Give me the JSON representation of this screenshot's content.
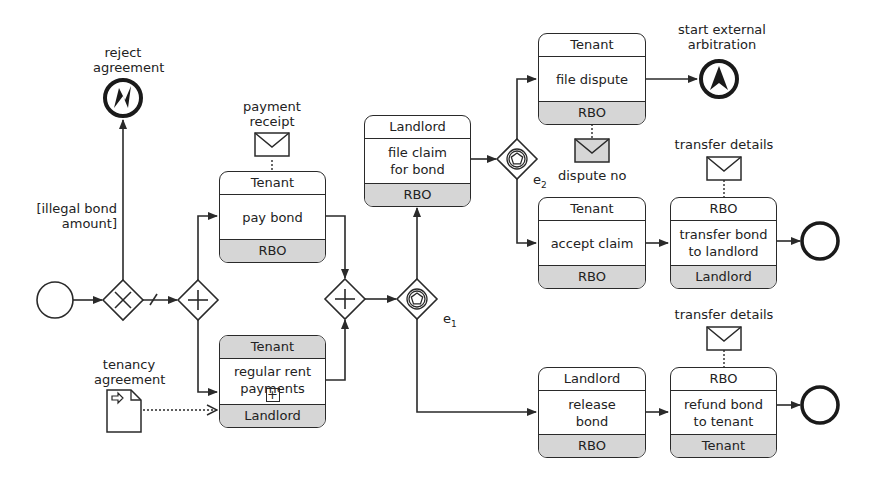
{
  "diagram": {
    "type": "BPMN choreography",
    "events": {
      "start": {
        "label": ""
      },
      "reject_agreement": {
        "label_line1": "reject",
        "label_line2": "agreement",
        "icon": "error-end-icon"
      },
      "start_arbitration": {
        "label_line1": "start external",
        "label_line2": "arbitration",
        "icon": "escalation-end-icon"
      },
      "end_transfer": {
        "label": ""
      },
      "end_refund": {
        "label": ""
      }
    },
    "conditions": {
      "illegal_bond_line1": "[illegal bond",
      "illegal_bond_line2": "amount]"
    },
    "gateways": {
      "xor": {
        "type": "exclusive"
      },
      "split": {
        "type": "parallel"
      },
      "join": {
        "type": "parallel"
      },
      "e1": {
        "type": "event-based",
        "label": "e",
        "sub": "1"
      },
      "e2": {
        "type": "event-based",
        "label": "e",
        "sub": "2"
      }
    },
    "messages": {
      "payment_receipt": {
        "line1": "payment",
        "line2": "receipt"
      },
      "dispute_no": {
        "label": "dispute no"
      },
      "transfer_details_1": {
        "label": "transfer details"
      },
      "transfer_details_2": {
        "label": "transfer details"
      }
    },
    "data_objects": {
      "tenancy_agreement": {
        "line1": "tenancy",
        "line2": "agreement"
      }
    },
    "tasks": {
      "pay_bond": {
        "top": "Tenant",
        "name": "pay bond",
        "bottom": "RBO"
      },
      "regular_rent": {
        "top": "Tenant",
        "name_line1": "regular rent",
        "name_line2": "payments",
        "bottom": "Landlord",
        "marker": "+"
      },
      "file_claim": {
        "top": "Landlord",
        "name_line1": "file claim",
        "name_line2": "for bond",
        "bottom": "RBO"
      },
      "file_dispute": {
        "top": "Tenant",
        "name": "file dispute",
        "bottom": "RBO"
      },
      "accept_claim": {
        "top": "Tenant",
        "name": "accept claim",
        "bottom": "RBO"
      },
      "transfer_bond": {
        "top": "RBO",
        "name_line1": "transfer bond",
        "name_line2": "to landlord",
        "bottom": "Landlord"
      },
      "release_bond": {
        "top": "Landlord",
        "name_line1": "release",
        "name_line2": "bond",
        "bottom": "RBO"
      },
      "refund_bond": {
        "top": "RBO",
        "name_line1": "refund bond",
        "name_line2": "to tenant",
        "bottom": "Tenant"
      }
    },
    "colors": {
      "stroke": "#2a2a2a",
      "shaded_band": "#d6d6d6",
      "background": "#ffffff"
    }
  }
}
